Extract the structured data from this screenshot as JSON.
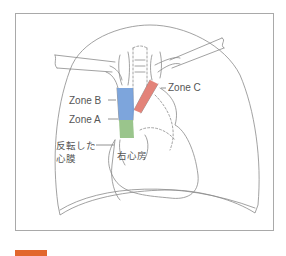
{
  "diagram": {
    "type": "anatomical chest illustration (heart, great vessels, lungs outline)",
    "labels": {
      "zone_c": "Zone C",
      "zone_b": "Zone B",
      "zone_a": "Zone A",
      "reflected_pericardium_line1": "反転した",
      "reflected_pericardium_line2": "心膜",
      "right_atrium": "右心房"
    },
    "colors": {
      "zone_a": "#8fbf7f",
      "zone_b": "#6f9bd8",
      "zone_c": "#e0756a",
      "outline": "#8a8a8a",
      "frame": "#a9a9a9",
      "figure_tag": "#e2672d"
    }
  }
}
